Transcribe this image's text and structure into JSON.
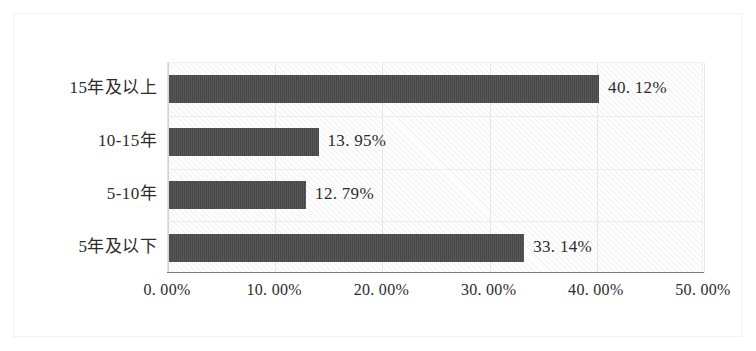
{
  "chart_data": {
    "type": "bar",
    "orientation": "horizontal",
    "title": "",
    "subtitle": "",
    "xlabel": "",
    "ylabel": "",
    "categories": [
      "5年及以下",
      "5-10年",
      "10-15年",
      "15年及以上"
    ],
    "values": [
      33.14,
      12.79,
      13.95,
      40.12
    ],
    "value_labels": [
      "33.14%",
      "12.79%",
      "13.95%",
      "40.12%"
    ],
    "xlim": [
      0,
      50
    ],
    "xticks": [
      0,
      10,
      20,
      30,
      40,
      50
    ],
    "xtick_labels": [
      "0. 00%",
      "10. 00%",
      "20. 00%",
      "30. 00%",
      "40. 00%",
      "50. 00%"
    ],
    "grid": true,
    "legend": false,
    "legend_position": "none",
    "bar_color": "#4b4b4b",
    "plot_background": "#fdfdfd",
    "gridline_color": "#e6e6e6",
    "axis_color": "#7d7d7d",
    "plot_pattern": "diagonal-hatch"
  },
  "rows": [
    {
      "label": "15年及以上",
      "value": 40.12,
      "value_label": "40. 12%"
    },
    {
      "label": "10-15年",
      "value": 13.95,
      "value_label": "13. 95%"
    },
    {
      "label": "5-10年",
      "value": 12.79,
      "value_label": "12. 79%"
    },
    {
      "label": "5年及以下",
      "value": 33.14,
      "value_label": "33. 14%"
    }
  ],
  "axis": {
    "ticks": [
      {
        "label": "0. 00%",
        "value": 0
      },
      {
        "label": "10. 00%",
        "value": 10
      },
      {
        "label": "20. 00%",
        "value": 20
      },
      {
        "label": "30. 00%",
        "value": 30
      },
      {
        "label": "40. 00%",
        "value": 40
      },
      {
        "label": "50. 00%",
        "value": 50
      }
    ]
  }
}
